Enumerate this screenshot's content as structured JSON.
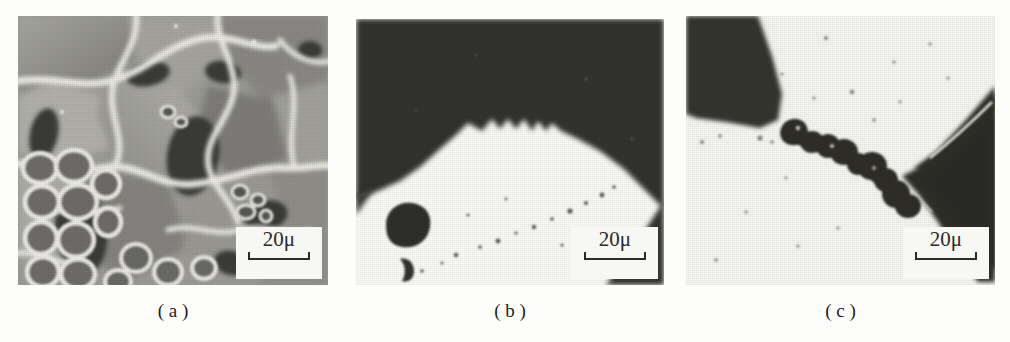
{
  "figure": {
    "background_color": "#fdfdfc",
    "panel_count": 3
  },
  "panels": [
    {
      "id": "panel-a",
      "caption": "( a )",
      "scale_bar": {
        "label": "20μ",
        "value": 20,
        "unit": "μ"
      },
      "image_type": "sem-fracture-surface",
      "description": "Scanning electron micrograph of an intergranular fracture surface with bright ridged grain boundaries, mid-gray facets, dark cavities and a cellular dimple cluster at lower left",
      "tone": {
        "highlight": "#f0efe9",
        "mid": "#9a9a94",
        "shadow": "#4a4a46",
        "deep": "#2e2e2c"
      },
      "bounds": {
        "x": 18,
        "y": 16,
        "width": 310,
        "height": 269
      }
    },
    {
      "id": "panel-b",
      "caption": "( b )",
      "scale_bar": {
        "label": "20μ",
        "value": 20,
        "unit": "μ"
      },
      "image_type": "optical-micrograph-interface",
      "description": "Dark upper matrix meeting a bright lower phase along a serrated sawtooth boundary; a large round inclusion and a smaller crescent pore at lower left and a faint trail of fine particles",
      "tone": {
        "highlight": "#fbfbf8",
        "mid": "#8d8d88",
        "shadow": "#3b3b39",
        "deep": "#2a2a28"
      },
      "bounds": {
        "x": 356,
        "y": 19,
        "width": 308,
        "height": 266
      }
    },
    {
      "id": "panel-c",
      "caption": "( c )",
      "scale_bar": {
        "label": "20μ",
        "value": 20,
        "unit": "μ"
      },
      "image_type": "optical-micrograph-crack",
      "description": "Bright matrix with a dark triangular wedge at the upper left, a large dark mass at the right, and a beaded chain of coalesced voids descending between them",
      "tone": {
        "highlight": "#f7f7f4",
        "mid": "#8a8a85",
        "shadow": "#35352f",
        "deep": "#26261f"
      },
      "bounds": {
        "x": 686,
        "y": 16,
        "width": 309,
        "height": 269
      }
    }
  ]
}
